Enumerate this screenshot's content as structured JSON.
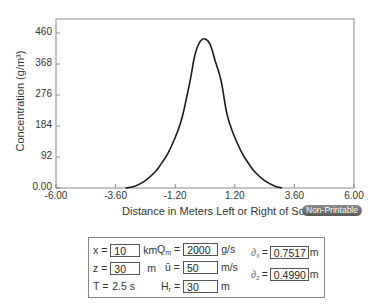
{
  "chart_data": {
    "type": "line",
    "title": "",
    "xlabel": "Distance in Meters Left or Right of Source",
    "ylabel": "Concentration (g/m³)",
    "xlim": [
      -6.0,
      6.0
    ],
    "ylim": [
      0,
      460
    ],
    "x_ticks": [
      "-6.00",
      "-3.60",
      "-1.20",
      "1.20",
      "3.60",
      "6.00"
    ],
    "y_ticks": [
      "0.00",
      "92",
      "184",
      "276",
      "368",
      "460"
    ],
    "grid": false,
    "legend": null,
    "series": [
      {
        "name": "Concentration",
        "x": [
          -3.2,
          -2.8,
          -2.4,
          -2.0,
          -1.8,
          -1.5,
          -1.2,
          -1.0,
          -0.85,
          -0.6,
          -0.45,
          -0.3,
          -0.1,
          0.1,
          0.25,
          0.4,
          0.65,
          0.85,
          1.0,
          1.2,
          1.5,
          1.8,
          2.0,
          2.4,
          2.8,
          3.1
        ],
        "values": [
          0,
          6,
          22,
          48,
          68,
          102,
          150,
          190,
          231,
          318,
          380,
          420,
          442,
          438,
          418,
          380,
          318,
          231,
          190,
          150,
          102,
          68,
          48,
          22,
          6,
          0
        ]
      }
    ]
  },
  "chart": {
    "ylabel_text": "Concentration (g/m³)",
    "xlabel_text": "Distance in Meters Left or Right of Source",
    "badge_label": "Non-Printable"
  },
  "panel": {
    "x_label": "x =",
    "x_value": "10",
    "x_unit": "km",
    "z_label": "z =",
    "z_value": "30",
    "z_unit": "m",
    "t_label": "T =",
    "t_value": "2.5 s",
    "qm_label": "Q",
    "qm_sub": "m",
    "qm_eq": "=",
    "qm_value": "2000",
    "qm_unit": "g/s",
    "u_label": "ū =",
    "u_value": "50",
    "u_unit": "m/s",
    "hr_label": "H",
    "hr_sub": "r",
    "hr_eq": "=",
    "hr_value": "30",
    "hr_unit": "m",
    "sx_label": "∂",
    "sx_sub": "x",
    "sx_eq": "=",
    "sx_value": "0.7517",
    "sx_unit": "m",
    "sz_label": "∂",
    "sz_sub": "z",
    "sz_eq": "=",
    "sz_value": "0.4990",
    "sz_unit": "m"
  }
}
